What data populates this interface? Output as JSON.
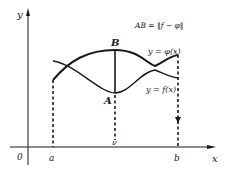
{
  "diagram": {
    "type": "function-norm-illustration",
    "axes": {
      "x_label": "x",
      "y_label": "y",
      "origin_label": "0"
    },
    "ticks": {
      "a_label": "a",
      "b_label": "b",
      "mid_label": "ν"
    },
    "points": {
      "A_label": "A",
      "B_label": "B"
    },
    "curves": {
      "phi_label": "y = φ(x)",
      "f_label": "y = f(x)"
    },
    "formula": "AB = ‖f − φ‖",
    "colors": {
      "stroke": "#1a1a1a",
      "background": "#ffffff"
    }
  }
}
